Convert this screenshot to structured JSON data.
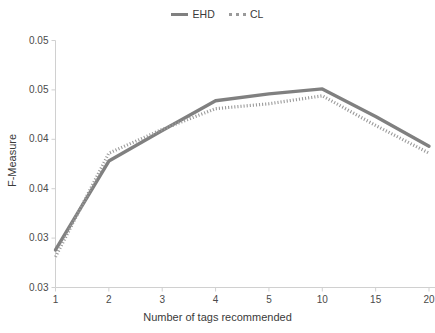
{
  "chart_data": {
    "type": "line",
    "title": "",
    "xlabel": "Number of tags recommended",
    "ylabel": "F-Measure",
    "categories": [
      "1",
      "2",
      "3",
      "4",
      "5",
      "10",
      "15",
      "20"
    ],
    "x_tick_labels": [
      "1",
      "2",
      "3",
      "4",
      "5",
      "10",
      "15",
      "20"
    ],
    "y_tick_labels": [
      "0.05",
      "0.05",
      "0.04",
      "0.04",
      "0.03",
      "0.03"
    ],
    "y_tick_values": [
      0.055,
      0.05,
      0.045,
      0.04,
      0.035,
      0.03
    ],
    "ylim": [
      0.03,
      0.055
    ],
    "grid": false,
    "legend_position": "top-center",
    "series": [
      {
        "name": "EHD",
        "style": "solid",
        "color": "#808080",
        "values": [
          0.0338,
          0.0428,
          0.0459,
          0.0489,
          0.0496,
          0.0501,
          0.0473,
          0.0443
        ]
      },
      {
        "name": "CL",
        "style": "dotted",
        "color": "#9a9a9a",
        "values": [
          0.0331,
          0.0436,
          0.046,
          0.0481,
          0.0486,
          0.0494,
          0.0464,
          0.0436
        ]
      }
    ]
  },
  "legend": {
    "items": [
      {
        "label": "EHD",
        "style": "solid",
        "color": "#808080"
      },
      {
        "label": "CL",
        "style": "dotted",
        "color": "#9a9a9a"
      }
    ]
  },
  "axes": {
    "x_title": "Number of tags recommended",
    "y_title": "F-Measure"
  },
  "colors": {
    "series_ehd": "#808080",
    "series_cl": "#9a9a9a",
    "axis_line": "#d0d0d0",
    "tick_text": "#4a4a4a",
    "background": "#ffffff"
  }
}
